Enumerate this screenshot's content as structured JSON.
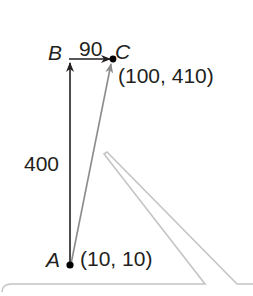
{
  "diagram": {
    "type": "vector-displacement",
    "points": {
      "A": {
        "label": "A",
        "coords_text": "(10, 10)"
      },
      "B": {
        "label": "B"
      },
      "C": {
        "label": "C",
        "coords_text": "(100, 410)"
      }
    },
    "segments": {
      "AB": {
        "length_text": "400"
      },
      "BC": {
        "length_text": "90"
      },
      "AC": {
        "style": "gray resultant arrow"
      }
    },
    "colors": {
      "ink": "#231f20",
      "resultant": "#8a8a8a",
      "callout_outline": "#bdbdbd"
    }
  }
}
